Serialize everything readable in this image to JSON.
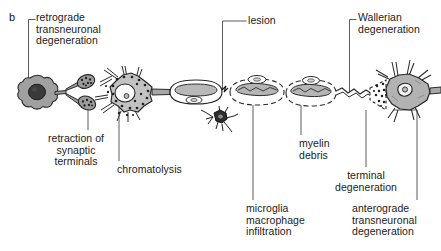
{
  "figure": {
    "panel_letter": "b",
    "background_color": "#ffffff",
    "ink_color": "#1a1a1a",
    "cell_fill_color": "#a8a8a8",
    "cell_fill_light": "#c9c9c9",
    "nucleus_color": "#3a3a3a",
    "myelin_fill_color": "#b5b5b5"
  },
  "labels": [
    {
      "id": "retrograde-transneuronal-degeneration",
      "text": "retrograde\ntransneuronal\ndegeneration",
      "align": "left",
      "x": 36,
      "y": 12
    },
    {
      "id": "retraction-of-synaptic-terminals",
      "text": "retraction of\nsynaptic\nterminals",
      "align": "center",
      "x": 28,
      "y": 133
    },
    {
      "id": "chromatolysis",
      "text": "chromatolysis",
      "align": "left",
      "x": 117,
      "y": 164
    },
    {
      "id": "lesion",
      "text": "lesion",
      "align": "left",
      "x": 248,
      "y": 15
    },
    {
      "id": "microglia-macrophage-infiltration",
      "text": "microglia\nmacrophage\ninfiltration",
      "align": "left",
      "x": 246,
      "y": 203
    },
    {
      "id": "myelin-debris",
      "text": "myelin\ndebris",
      "align": "left",
      "x": 299,
      "y": 138
    },
    {
      "id": "terminal-degeneration",
      "text": "terminal\ndegeneration",
      "align": "center",
      "x": 292,
      "y": 170
    },
    {
      "id": "wallerian-degeneration",
      "text": "Wallerian\ndegeneration",
      "align": "left",
      "x": 358,
      "y": 12
    },
    {
      "id": "anterograde-transneuronal-degeneration",
      "text": "anterograde\ntransneuronal\ndegeneration",
      "align": "left",
      "x": 352,
      "y": 203
    }
  ],
  "structures": [
    {
      "id": "retrograde-cell-body",
      "name": "retrograde degenerating cell body"
    },
    {
      "id": "presynaptic-terminal-upper",
      "name": "upper retracting synaptic terminal"
    },
    {
      "id": "presynaptic-terminal-lower",
      "name": "lower retracting synaptic terminal"
    },
    {
      "id": "chromatolytic-neuron",
      "name": "chromatolytic multipolar neuron"
    },
    {
      "id": "myelin-segment-intact",
      "name": "intact myelinated axon segment"
    },
    {
      "id": "microglial-cell",
      "name": "microglia / macrophage"
    },
    {
      "id": "myelin-segment-debris-1",
      "name": "degenerating myelin segment 1"
    },
    {
      "id": "myelin-segment-debris-2",
      "name": "degenerating myelin segment 2"
    },
    {
      "id": "degenerating-terminal",
      "name": "fragmenting axon terminal"
    },
    {
      "id": "anterograde-neuron",
      "name": "anterograde degenerating neuron"
    }
  ]
}
